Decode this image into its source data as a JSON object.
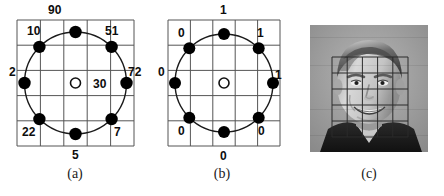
{
  "figure": {
    "panels": [
      {
        "id": "a",
        "caption": "(a)",
        "center_marker": "O",
        "center_value": "30",
        "grid_rows": 5,
        "grid_cols": 5,
        "neighbor_labels": [
          {
            "pos": "top",
            "value": "90"
          },
          {
            "pos": "top-left",
            "value": "10"
          },
          {
            "pos": "top-right",
            "value": "51"
          },
          {
            "pos": "left",
            "value": "2"
          },
          {
            "pos": "right",
            "value": "72"
          },
          {
            "pos": "bottom-left",
            "value": "22"
          },
          {
            "pos": "bottom-right",
            "value": "7"
          },
          {
            "pos": "bottom",
            "value": "5"
          }
        ]
      },
      {
        "id": "b",
        "caption": "(b)",
        "center_marker": "O",
        "center_value": "",
        "grid_rows": 5,
        "grid_cols": 5,
        "neighbor_labels": [
          {
            "pos": "top",
            "value": "1"
          },
          {
            "pos": "top-left",
            "value": "0"
          },
          {
            "pos": "top-right",
            "value": "1"
          },
          {
            "pos": "left",
            "value": "0"
          },
          {
            "pos": "right",
            "value": "1"
          },
          {
            "pos": "bottom-left",
            "value": "0"
          },
          {
            "pos": "bottom-right",
            "value": "0"
          },
          {
            "pos": "bottom",
            "value": "0"
          }
        ]
      },
      {
        "id": "c",
        "caption": "(c)",
        "content": "grayscale-face-photo-with-grid-overlay",
        "overlay_grid_rows": 5,
        "overlay_grid_cols": 5
      }
    ]
  },
  "colors": {
    "grid_line": "#555555",
    "circle_line": "#1a1a1a",
    "sample_point": "#000000",
    "text": "#0d0d0d",
    "background": "#ffffff"
  }
}
